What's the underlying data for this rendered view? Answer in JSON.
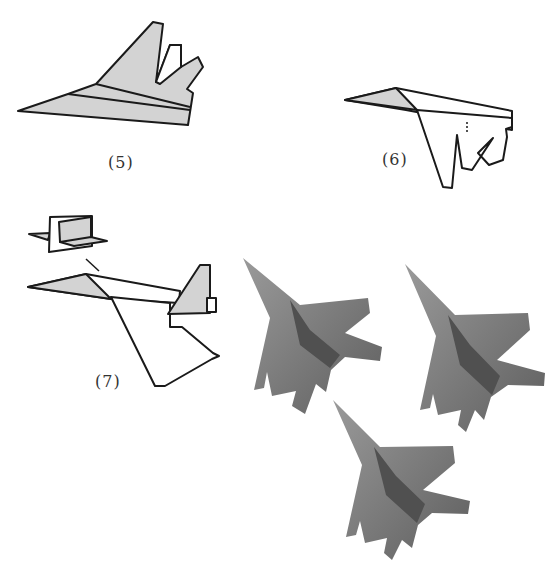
{
  "page": {
    "type": "origami instruction diagram",
    "background": "#ffffff"
  },
  "steps": [
    {
      "id": "step-5",
      "label": "(5)",
      "description": "Folded paper plane with grey shaded wings and twin tail fins"
    },
    {
      "id": "step-6",
      "label": "(6)",
      "description": "Plane viewed from side with shaded nose tip; tail cut shapes"
    },
    {
      "id": "step-7",
      "label": "(7)",
      "description": "Completed plane with shaded nose and tail fin; inset detail of tail"
    }
  ],
  "photo": {
    "description": "Photograph of three finished grey origami fighter jets",
    "count": 3,
    "color": "#7a7a7a"
  },
  "colors": {
    "shade": "#d3d3d3",
    "stroke": "#1a1a1a",
    "jet": "#7c7c7c",
    "jet_dark": "#555555",
    "jet_light": "#9a9a9a"
  }
}
